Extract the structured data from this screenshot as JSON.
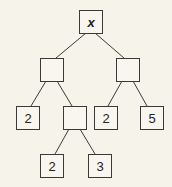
{
  "diagram": {
    "type": "expression-tree",
    "colors": {
      "background": "#f6f3ea",
      "stroke": "#3a3a3a",
      "text": "#222222"
    },
    "nodes": [
      {
        "id": "root",
        "label": "x",
        "x": 79,
        "y": 10
      },
      {
        "id": "left",
        "label": "",
        "x": 40,
        "y": 58
      },
      {
        "id": "right",
        "label": "",
        "x": 116,
        "y": 58
      },
      {
        "id": "left-leaf",
        "label": "2",
        "x": 16,
        "y": 106
      },
      {
        "id": "left-mid",
        "label": "",
        "x": 63,
        "y": 106
      },
      {
        "id": "right-leaf-a",
        "label": "2",
        "x": 94,
        "y": 106
      },
      {
        "id": "right-leaf-b",
        "label": "5",
        "x": 140,
        "y": 106
      },
      {
        "id": "mid-leaf-a",
        "label": "2",
        "x": 40,
        "y": 154
      },
      {
        "id": "mid-leaf-b",
        "label": "3",
        "x": 88,
        "y": 154
      }
    ],
    "edges": [
      [
        "root",
        "left"
      ],
      [
        "root",
        "right"
      ],
      [
        "left",
        "left-leaf"
      ],
      [
        "left",
        "left-mid"
      ],
      [
        "right",
        "right-leaf-a"
      ],
      [
        "right",
        "right-leaf-b"
      ],
      [
        "left-mid",
        "mid-leaf-a"
      ],
      [
        "left-mid",
        "mid-leaf-b"
      ]
    ]
  }
}
